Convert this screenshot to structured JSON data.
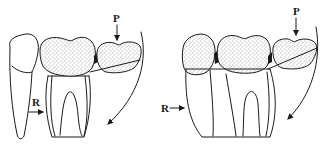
{
  "figure": {
    "panels": [
      {
        "id": "left",
        "labels": {
          "pressure": "P",
          "resistance": "R"
        },
        "description": "Tilted molar with adjacent teeth; pressure arrow P on distal crown, resistance arrow R at mesial root, curved rotation arrow"
      },
      {
        "id": "right",
        "labels": {
          "pressure": "P",
          "resistance": "R"
        },
        "description": "Upright molar with adjacent teeth; pressure arrow P on distal crown, resistance arrow R at mesial root surface, curved rotation arrow"
      }
    ],
    "colors": {
      "ink": "#1a1a1a",
      "background": "#ffffff"
    }
  }
}
